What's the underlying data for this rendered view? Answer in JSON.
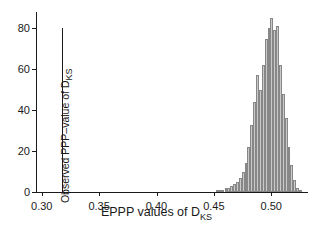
{
  "chart_data": {
    "type": "bar",
    "title": "",
    "subtitle": "",
    "xlabel_main": "EPPP values of D",
    "xlabel_sub": "KS",
    "ylabel": "",
    "xlim": [
      0.295,
      0.532
    ],
    "ylim": [
      0,
      88
    ],
    "grid": false,
    "legend": null,
    "xticks": [
      0.3,
      0.35,
      0.4,
      0.45,
      0.5
    ],
    "xtick_labels": [
      "0.30",
      "0.35",
      "0.40",
      "0.45",
      "0.50"
    ],
    "yticks": [
      0,
      20,
      40,
      60,
      80
    ],
    "ytick_labels": [
      "0",
      "20",
      "40",
      "60",
      "80"
    ],
    "bar_width": 0.0025,
    "bar_fill": "#c9c9c9",
    "bar_stroke": "#878787",
    "axis_color": "#1a1a1a",
    "x": [
      0.453,
      0.4555,
      0.458,
      0.4605,
      0.463,
      0.4655,
      0.468,
      0.4705,
      0.473,
      0.4755,
      0.478,
      0.4805,
      0.483,
      0.4855,
      0.488,
      0.4905,
      0.493,
      0.4955,
      0.498,
      0.5005,
      0.503,
      0.5055,
      0.508,
      0.5105,
      0.513,
      0.5155,
      0.518,
      0.5205,
      0.523,
      0.5255
    ],
    "values": [
      1,
      1,
      1,
      2,
      2,
      3,
      4,
      5,
      7,
      10,
      14,
      22,
      33,
      44,
      57,
      50,
      62,
      75,
      80,
      85,
      79,
      81,
      62,
      48,
      36,
      22,
      13,
      6,
      2,
      1
    ],
    "annotations": [
      {
        "name": "observed-ppp-line",
        "x": 0.318,
        "label_main": "Observed PPP–value of D",
        "label_sub": "KS",
        "orientation": "vertical",
        "y_top": 80,
        "y_bottom": 0,
        "color": "#1a1a1a"
      }
    ]
  }
}
